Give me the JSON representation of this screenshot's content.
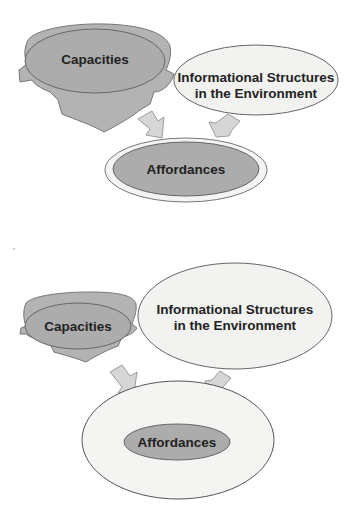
{
  "diagram_top": {
    "capacities_label": "Capacities",
    "info_label_line1": "Informational Structures",
    "info_label_line2": "in the Environment",
    "affordances_label": "Affordances"
  },
  "diagram_bottom": {
    "capacities_label": "Capacities",
    "info_label_line1": "Informational Structures",
    "info_label_line2": "in the Environment",
    "affordances_label": "Affordances"
  },
  "colors": {
    "head_fill": "#b3b3b3",
    "capacities_fill": "#acacac",
    "info_fill": "#f2f2f0",
    "affordances_fill": "#acacac",
    "outer_fill": "#f4f4f2",
    "arrow_fill": "#d6d6d6",
    "stroke": "#666666"
  }
}
